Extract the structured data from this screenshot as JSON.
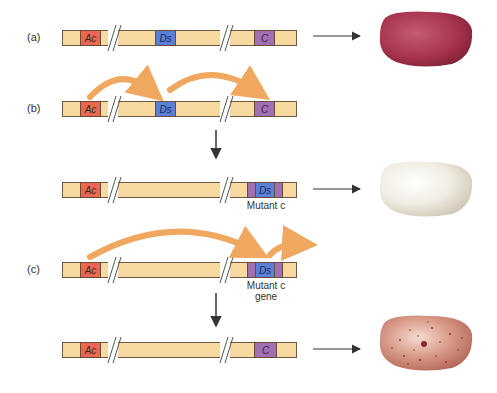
{
  "panels": [
    {
      "id": "a",
      "label": "(a)",
      "genes": [
        "Ac",
        "Ds",
        "C"
      ],
      "kernel": "solid red-purple kernel"
    },
    {
      "id": "b",
      "label": "(b)",
      "genes": [
        "Ac",
        "Ds",
        "C"
      ],
      "arrows": [
        "Ac → Ds",
        "Ds → C"
      ]
    },
    {
      "id": "b-result",
      "label": "",
      "genes": [
        "Ac",
        "Ds"
      ],
      "mutant_label": "Mutant c",
      "kernel": "colorless white kernel"
    },
    {
      "id": "c",
      "label": "(c)",
      "genes": [
        "Ac",
        "Ds"
      ],
      "mutant_label_line1": "Mutant c",
      "mutant_label_line2": "gene",
      "arrows": [
        "Ac → Ds",
        "Ds excises"
      ]
    },
    {
      "id": "c-result",
      "label": "",
      "genes": [
        "Ac",
        "C"
      ],
      "kernel": "spotted kernel"
    }
  ],
  "colors": {
    "chromosome": "#f8d9a0",
    "ac": "#e8694f",
    "ds": "#5a7fd6",
    "c": "#a070b0",
    "transposition_arrow": "#f0a860",
    "kernel_red": "#a8354d",
    "kernel_white": "#efeae0",
    "kernel_spotted": "#c87a68"
  }
}
